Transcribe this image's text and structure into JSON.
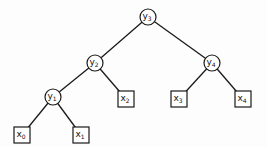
{
  "diagram": {
    "type": "binary-tree",
    "internal_nodes": [
      {
        "id": "y3",
        "base": "y",
        "sub": "3",
        "x": 148,
        "y": 17,
        "shape": "circle"
      },
      {
        "id": "y2",
        "base": "y",
        "sub": "2",
        "x": 95,
        "y": 63,
        "shape": "circle"
      },
      {
        "id": "y4",
        "base": "y",
        "sub": "4",
        "x": 212,
        "y": 63,
        "shape": "circle"
      },
      {
        "id": "y1",
        "base": "y",
        "sub": "1",
        "x": 53,
        "y": 97,
        "shape": "circle"
      }
    ],
    "leaf_nodes": [
      {
        "id": "x0",
        "base": "x",
        "sub": "0",
        "x": 22,
        "y": 135,
        "shape": "square"
      },
      {
        "id": "x1",
        "base": "x",
        "sub": "1",
        "x": 81,
        "y": 135,
        "shape": "square"
      },
      {
        "id": "x2",
        "base": "x",
        "sub": "2",
        "x": 126,
        "y": 99,
        "shape": "square"
      },
      {
        "id": "x3",
        "base": "x",
        "sub": "3",
        "x": 179,
        "y": 99,
        "shape": "square"
      },
      {
        "id": "x4",
        "base": "x",
        "sub": "4",
        "x": 243,
        "y": 99,
        "shape": "square"
      }
    ],
    "edges": [
      [
        "y3",
        "y2"
      ],
      [
        "y3",
        "y4"
      ],
      [
        "y2",
        "y1"
      ],
      [
        "y2",
        "x2"
      ],
      [
        "y4",
        "x3"
      ],
      [
        "y4",
        "x4"
      ],
      [
        "y1",
        "x0"
      ],
      [
        "y1",
        "x1"
      ]
    ]
  }
}
